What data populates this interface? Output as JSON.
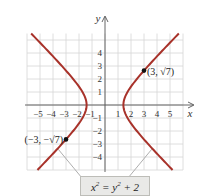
{
  "chart_data": {
    "type": "line",
    "title": "",
    "xlabel": "x",
    "ylabel": "y",
    "xlim": [
      -6,
      6
    ],
    "ylim": [
      -5,
      5.5
    ],
    "grid": true,
    "x_ticks": [
      -5,
      -4,
      -3,
      -2,
      -1,
      1,
      2,
      3,
      4,
      5
    ],
    "y_ticks": [
      -4,
      -3,
      -2,
      -1,
      1,
      2,
      3,
      4
    ],
    "x_tick_labels": [
      "−5",
      "−4",
      "−3",
      "−2",
      "−1",
      "1",
      "2",
      "3",
      "4",
      "5"
    ],
    "y_tick_labels": [
      "−4",
      "−3",
      "−2",
      "−1",
      "1",
      "2",
      "3",
      "4"
    ],
    "series": [
      {
        "name": "hyperbola",
        "equation": "x^2 = y^2 + 2",
        "color": "#a8322a",
        "branches": [
          "right",
          "left"
        ],
        "y_range": [
          -5,
          5.5
        ]
      }
    ],
    "points": [
      {
        "x": 3,
        "y": 2.6458,
        "label": "(3, √7)"
      },
      {
        "x": -3,
        "y": -2.6458,
        "label": "(−3, −√7)"
      }
    ],
    "annotation": {
      "equation_label": "x² = y² + 2"
    }
  },
  "colors": {
    "curve": "#a8322a",
    "grid": "#d6d6d6",
    "axis": "#555555",
    "point": "#111111"
  }
}
